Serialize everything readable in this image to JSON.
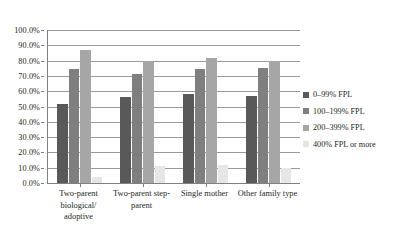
{
  "chart_data": {
    "type": "bar",
    "title": "",
    "subtitle": "",
    "xlabel": "",
    "ylabel": "",
    "ylim": [
      0,
      100
    ],
    "ytick_labels": [
      "100.0%",
      "90.0%",
      "80.0%",
      "70.0%",
      "60.0%",
      "50.0%",
      "40.0%",
      "30.0%",
      "20.0%",
      "10.0%",
      "0.0%"
    ],
    "ytick_values": [
      100,
      90,
      80,
      70,
      60,
      50,
      40,
      30,
      20,
      10,
      0
    ],
    "grid": true,
    "legend_position": "right",
    "categories": [
      "Two-parent biological/ adoptive",
      "Two-parent step-parent",
      "Single mother",
      "Other family type"
    ],
    "series": [
      {
        "name": "0–99% FPL",
        "color": "#595959",
        "values": [
          51.5,
          56.5,
          58.5,
          57.0
        ]
      },
      {
        "name": "100–199% FPL",
        "color": "#7f7f7f",
        "values": [
          74.5,
          71.5,
          74.5,
          75.5
        ]
      },
      {
        "name": "200–399% FPL",
        "color": "#a6a6a6",
        "values": [
          87.0,
          79.5,
          81.5,
          79.5
        ]
      },
      {
        "name": "400% FPL or more",
        "color": "#e6e6e6",
        "values": [
          4.0,
          11.0,
          12.0,
          10.0
        ]
      }
    ]
  }
}
